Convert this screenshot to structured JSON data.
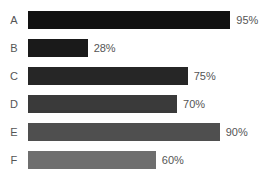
{
  "chart_data": {
    "type": "bar",
    "orientation": "horizontal",
    "title": "",
    "subtitle": "",
    "xlabel": "",
    "ylabel": "",
    "grid": false,
    "legend": false,
    "legend_position": "none",
    "value_suffix": "%",
    "xlim": [
      0,
      100
    ],
    "axis_visible": false,
    "tick_labels": [],
    "categories": [
      "A",
      "B",
      "C",
      "D",
      "E",
      "F"
    ],
    "values": [
      95,
      28,
      75,
      70,
      90,
      60
    ],
    "value_labels": [
      "95%",
      "28%",
      "75%",
      "70%",
      "90%",
      "60%"
    ],
    "bar_colors": [
      "#111111",
      "#1a1a1a",
      "#262626",
      "#3a3a3a",
      "#4f4f4f",
      "#6e6e6e"
    ],
    "background_color": "#ffffff",
    "label_color": "#555555",
    "bars": [
      {
        "category": "A",
        "value": 95,
        "label": "95%",
        "color": "#111111"
      },
      {
        "category": "B",
        "value": 28,
        "label": "28%",
        "color": "#1a1a1a"
      },
      {
        "category": "C",
        "value": 75,
        "label": "75%",
        "color": "#262626"
      },
      {
        "category": "D",
        "value": 70,
        "label": "70%",
        "color": "#3a3a3a"
      },
      {
        "category": "E",
        "value": 90,
        "label": "90%",
        "color": "#4f4f4f"
      },
      {
        "category": "F",
        "value": 60,
        "label": "60%",
        "color": "#6e6e6e"
      }
    ]
  }
}
